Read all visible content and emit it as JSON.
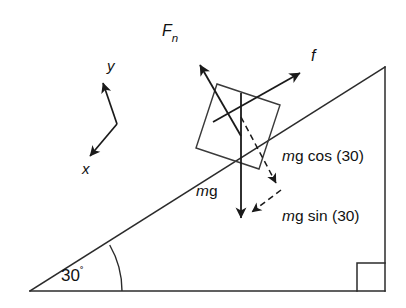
{
  "figure": {
    "background_color": "#ffffff",
    "line_color": "#2b2b2b",
    "vector_color": "#1a1a1a",
    "text_color": "#111111"
  },
  "labels": {
    "normal_force": "F",
    "normal_force_subscript": "n",
    "friction": "f",
    "weight": "mg",
    "weight_italic_part": "m",
    "weight_upright_part": "g",
    "component_normal": "mg cos (30)",
    "component_normal_italic": "m",
    "component_normal_rest": "g cos (30)",
    "component_parallel": "mg sin (30)",
    "component_parallel_italic": "m",
    "component_parallel_rest": "g sin (30)",
    "axis_x": "x",
    "axis_y": "y",
    "incline_angle": "30",
    "degree_symbol": "˚"
  },
  "geometry": {
    "incline_angle_degrees": 30,
    "triangle_left_vertex": [
      30,
      291
    ],
    "triangle_right_vertex": [
      385,
      291
    ],
    "triangle_apex": [
      385,
      67
    ],
    "right_angle_marker": {
      "x": 357,
      "y": 263,
      "size": 28
    },
    "angle_arc_radius": 92
  },
  "vectors": [
    {
      "name": "normal-force",
      "label": "F_n",
      "tail": [
        241,
        136
      ],
      "head": [
        196,
        58
      ],
      "style": "solid"
    },
    {
      "name": "friction-force",
      "label": "f",
      "tail": [
        213,
        122
      ],
      "head": [
        304,
        71
      ],
      "style": "solid"
    },
    {
      "name": "weight",
      "label": "mg",
      "tail": [
        241,
        93
      ],
      "head": [
        241,
        222
      ],
      "style": "solid"
    },
    {
      "name": "mg-cos-component",
      "label": "mg cos (30)",
      "tail": [
        241,
        117
      ],
      "head": [
        279,
        188
      ],
      "style": "dashed"
    },
    {
      "name": "mg-sin-component",
      "label": "mg sin (30)",
      "tail": [
        281,
        190
      ],
      "head": [
        249,
        214
      ],
      "style": "dashed"
    }
  ],
  "axes": {
    "origin": [
      117,
      124
    ],
    "y_head": [
      100,
      79
    ],
    "x_head": [
      86,
      159
    ]
  },
  "block": {
    "name": "block-on-incline",
    "corners": [
      [
        196,
        148
      ],
      [
        217,
        84
      ],
      [
        280,
        105
      ],
      [
        259,
        169
      ]
    ]
  }
}
